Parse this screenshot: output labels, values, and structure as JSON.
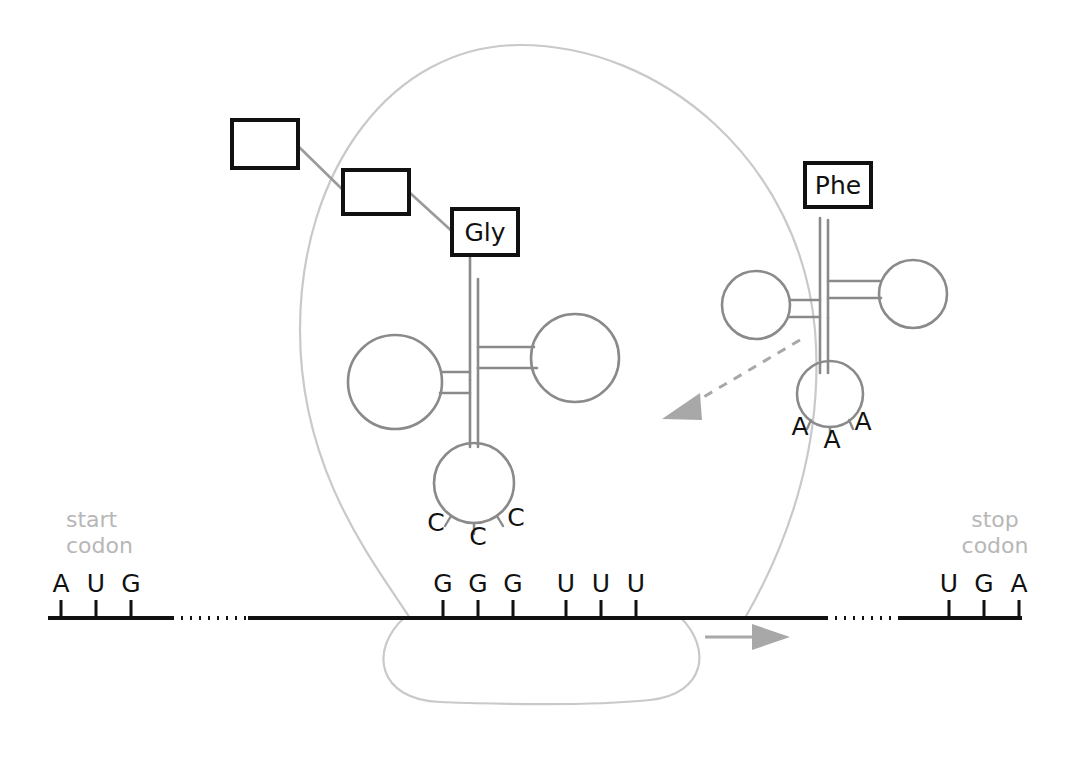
{
  "figure": {
    "colors": {
      "ink": "#111111",
      "trna_gray": "#8a8a8a",
      "ribosome_gray": "#c9c9c9",
      "label_gray": "#b7b7b7",
      "arrow_gray": "#a8a8a8",
      "background": "#ffffff"
    }
  },
  "polypeptide": {
    "residues": [
      {
        "label": "",
        "name": "empty-residue-1"
      },
      {
        "label": "",
        "name": "empty-residue-2"
      },
      {
        "label": "Gly",
        "name": "glycine-residue"
      }
    ]
  },
  "trna_left": {
    "amino_acid": "Gly",
    "anticodon": [
      "C",
      "C",
      "C"
    ]
  },
  "trna_right": {
    "amino_acid": "Phe",
    "anticodon": [
      "A",
      "A",
      "A"
    ]
  },
  "mrna": {
    "start_codon_label": "start\ncodon",
    "start_codon_label_line1": "start",
    "start_codon_label_line2": "codon",
    "stop_codon_label_line1": "stop",
    "stop_codon_label_line2": "codon",
    "start_codon": [
      "A",
      "U",
      "G"
    ],
    "codon_gly": [
      "G",
      "G",
      "G"
    ],
    "codon_phe": [
      "U",
      "U",
      "U"
    ],
    "stop_codon": [
      "U",
      "G",
      "A"
    ]
  },
  "arrows": {
    "movement_direction": "right",
    "incoming_trna_direction": "down-left"
  },
  "ribosome": {
    "large_subunit": "large-subunit-outline",
    "small_subunit": "small-subunit-outline"
  }
}
